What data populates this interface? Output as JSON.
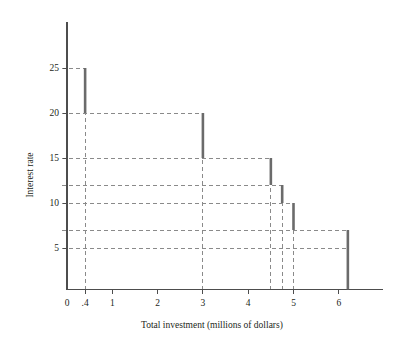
{
  "chart_data": {
    "type": "line",
    "title": "",
    "subtitle": "",
    "xlabel": "Total investment (millions of dollars)",
    "ylabel": "Interest rate",
    "xlim": [
      0,
      7
    ],
    "ylim": [
      0,
      27.5
    ],
    "grid": "dashed-guides-only",
    "legend": "none",
    "x_ticks": [
      {
        "value": 0,
        "label": "0"
      },
      {
        "value": 0.4,
        "label": ".4"
      },
      {
        "value": 1,
        "label": "1"
      },
      {
        "value": 2,
        "label": "2"
      },
      {
        "value": 3,
        "label": "3"
      },
      {
        "value": 4,
        "label": "4"
      },
      {
        "value": 5,
        "label": "5"
      },
      {
        "value": 6,
        "label": "6"
      }
    ],
    "y_ticks": [
      {
        "value": 5,
        "label": "5"
      },
      {
        "value": 10,
        "label": "10"
      },
      {
        "value": 15,
        "label": "15"
      },
      {
        "value": 20,
        "label": "20"
      },
      {
        "value": 25,
        "label": "25"
      }
    ],
    "steps": [
      {
        "x": 0.4,
        "rate_top": 25,
        "rate_bottom": 20
      },
      {
        "x": 3.0,
        "rate_top": 20,
        "rate_bottom": 15
      },
      {
        "x": 4.5,
        "rate_top": 15,
        "rate_bottom": 12
      },
      {
        "x": 4.75,
        "rate_top": 12,
        "rate_bottom": 10
      },
      {
        "x": 5.0,
        "rate_top": 10,
        "rate_bottom": 7
      },
      {
        "x": 6.2,
        "rate_top": 7,
        "rate_bottom": 5
      }
    ],
    "horizontal_guides": [
      25,
      20,
      15,
      12,
      10,
      7,
      5
    ],
    "vertical_guides": [
      0.4,
      3.0,
      4.5,
      4.75,
      5.0,
      6.2
    ],
    "series": [
      {
        "name": "Investment demand",
        "x": [
          0,
          0.4,
          0.4,
          3.0,
          3.0,
          4.5,
          4.5,
          4.75,
          4.75,
          5.0,
          5.0,
          6.2,
          6.2
        ],
        "values": [
          25,
          25,
          20,
          20,
          15,
          15,
          12,
          12,
          10,
          10,
          7,
          7,
          5
        ]
      }
    ]
  },
  "colors": {
    "bar": "#6b6b6b",
    "guide": "#8a8a8a",
    "axis": "#4d4d4d",
    "text": "#231f20",
    "background": "#ffffff"
  }
}
